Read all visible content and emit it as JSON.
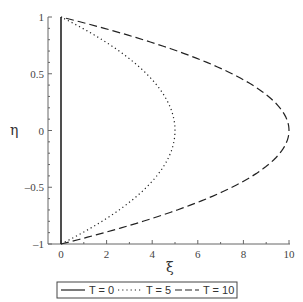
{
  "chart_data": {
    "type": "line",
    "title": "",
    "xlabel": "ξ",
    "ylabel": "η",
    "xlim": [
      0,
      10
    ],
    "ylim": [
      -1,
      1
    ],
    "x_ticks": [
      0,
      2,
      4,
      6,
      8,
      10
    ],
    "x_tick_labels": [
      "0",
      "2",
      "4",
      "6",
      "8",
      "10"
    ],
    "y_ticks": [
      1,
      0.5,
      0,
      -0.5,
      -1
    ],
    "y_tick_labels": [
      "1",
      "0.5",
      "0",
      "–0.5",
      "–1"
    ],
    "grid": false,
    "legend_position": "bottom",
    "relation": "ξ = T(1 − η²)/2",
    "series": [
      {
        "name": "T = 0",
        "style": "solid",
        "T": 0,
        "eta": [
          -1,
          -0.5,
          0,
          0.5,
          1
        ],
        "xi": [
          0,
          0,
          0,
          0,
          0
        ]
      },
      {
        "name": "T = 5",
        "style": "dotted",
        "T": 5,
        "eta": [
          -1,
          -0.75,
          -0.5,
          -0.25,
          0,
          0.25,
          0.5,
          0.75,
          1
        ],
        "xi": [
          0,
          1.09,
          1.88,
          2.34,
          2.5,
          2.34,
          1.88,
          1.09,
          0
        ]
      },
      {
        "name": "T = 10",
        "style": "dashed",
        "T": 10,
        "eta": [
          -1,
          -0.75,
          -0.5,
          -0.25,
          0,
          0.25,
          0.5,
          0.75,
          1
        ],
        "xi": [
          0,
          2.19,
          3.75,
          4.69,
          5,
          4.69,
          3.75,
          2.19,
          0
        ]
      }
    ]
  },
  "legend": {
    "items": [
      {
        "label": "T = 0",
        "style": "solid"
      },
      {
        "label": "T = 5",
        "style": "dotted"
      },
      {
        "label": "T = 10",
        "style": "dashed"
      }
    ]
  },
  "colors": {
    "line": "#222222",
    "axis": "#555555",
    "text": "#333333"
  }
}
